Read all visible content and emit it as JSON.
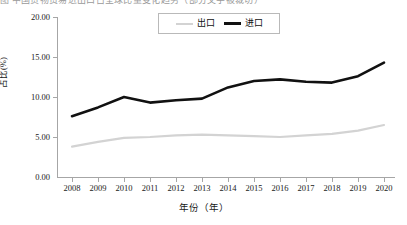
{
  "caption": {
    "partial_text_sliver": "图 中国货物贸易进出口占全球比重变化趋势（部分文字被裁切）"
  },
  "legend": {
    "position": "top-center",
    "items": [
      {
        "label": "出口",
        "color": "#d3d3d3",
        "style": "thin-line"
      },
      {
        "label": "进口",
        "color": "#111111",
        "style": "thick-line"
      }
    ]
  },
  "axes": {
    "y_title": "占比(%)",
    "x_title": "年份（年）",
    "y_ticks": [
      "0.00",
      "5.00",
      "10.00",
      "15.00",
      "20.00"
    ],
    "x_ticks": [
      "2008",
      "2009",
      "2010",
      "2011",
      "2012",
      "2013",
      "2014",
      "2015",
      "2016",
      "2017",
      "2018",
      "2019",
      "2020"
    ]
  },
  "chart_data": {
    "type": "line",
    "title": "",
    "xlabel": "年份（年）",
    "ylabel": "占比(%)",
    "x": [
      2008,
      2009,
      2010,
      2011,
      2012,
      2013,
      2014,
      2015,
      2016,
      2017,
      2018,
      2019,
      2020
    ],
    "categories": [
      "2008",
      "2009",
      "2010",
      "2011",
      "2012",
      "2013",
      "2014",
      "2015",
      "2016",
      "2017",
      "2018",
      "2019",
      "2020"
    ],
    "series": [
      {
        "name": "出口",
        "color": "#d3d3d3",
        "values": [
          3.8,
          4.4,
          4.9,
          5.0,
          5.2,
          5.3,
          5.2,
          5.1,
          5.0,
          5.2,
          5.4,
          5.8,
          6.5
        ]
      },
      {
        "name": "进口",
        "color": "#111111",
        "values": [
          7.6,
          8.7,
          10.0,
          9.3,
          9.6,
          9.8,
          11.2,
          12.0,
          12.2,
          11.9,
          11.8,
          12.6,
          14.3
        ]
      }
    ],
    "xlim": [
      2008,
      2020
    ],
    "ylim": [
      0.0,
      20.0
    ],
    "ytick_step": 5.0,
    "grid": false,
    "legend_position": "top-center"
  }
}
